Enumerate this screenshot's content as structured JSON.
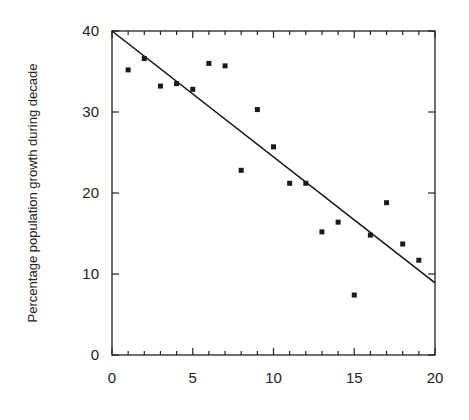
{
  "chart_data": {
    "type": "scatter",
    "title": "",
    "xlabel": "",
    "ylabel": "Percentage population growth during decade",
    "xlim": [
      0,
      20
    ],
    "ylim": [
      0,
      40
    ],
    "x_ticks_major": [
      0,
      5,
      10,
      15,
      20
    ],
    "x_ticks_minor_step": 1,
    "y_ticks_major": [
      0,
      10,
      20,
      30,
      40
    ],
    "grid": false,
    "legend": null,
    "frame": "box",
    "series": [
      {
        "name": "observations",
        "marker": "square",
        "x": [
          1,
          2,
          3,
          4,
          5,
          6,
          7,
          8,
          9,
          10,
          11,
          12,
          13,
          14,
          15,
          16,
          17,
          18,
          19
        ],
        "y": [
          35.2,
          36.6,
          33.2,
          33.5,
          32.8,
          36.0,
          35.7,
          22.8,
          30.3,
          25.7,
          21.2,
          21.2,
          15.2,
          16.4,
          7.4,
          14.8,
          18.8,
          13.7,
          11.7
        ]
      }
    ],
    "regression_line": {
      "x": [
        0,
        20
      ],
      "y": [
        40.0,
        8.9
      ],
      "slope": -1.555,
      "intercept": 40.0
    }
  },
  "colors": {
    "axis": "#222222",
    "marker": "#1a1a1a",
    "line": "#111111"
  }
}
